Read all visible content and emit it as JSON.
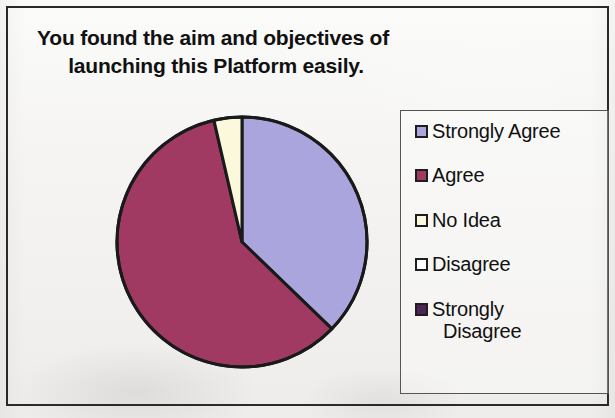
{
  "chart_data": {
    "type": "pie",
    "title": "You found the aim and objectives of launching this Platform easily.",
    "title_line1": "You found the aim and objectives of",
    "title_line2": "launching this Platform easily.",
    "categories": [
      "Strongly Agree",
      "Agree",
      "No Idea",
      "Disagree",
      "Strongly Disagree"
    ],
    "values": [
      37,
      59,
      4,
      0,
      0
    ],
    "units": "percent",
    "colors": [
      "#aaa6dd",
      "#a03a63",
      "#fbf8dc",
      "#ffffff",
      "#4d2456"
    ],
    "start_angle_deg": 0,
    "direction": "clockwise",
    "legend_position": "right",
    "grid": false,
    "data_labels_shown": false,
    "slice_outline_color": "#1a1a1a",
    "slices": [
      {
        "label": "Strongly Agree",
        "value": 37,
        "color": "#aaa6dd",
        "start_deg": 0,
        "end_deg": 134
      },
      {
        "label": "Agree",
        "value": 59,
        "color": "#a03a63",
        "start_deg": 134,
        "end_deg": 347
      },
      {
        "label": "No Idea",
        "value": 4,
        "color": "#fbf8dc",
        "start_deg": 347,
        "end_deg": 360
      },
      {
        "label": "Disagree",
        "value": 0,
        "color": "#ffffff",
        "start_deg": 360,
        "end_deg": 360
      },
      {
        "label": "Strongly Disagree",
        "value": 0,
        "color": "#4d2456",
        "start_deg": 360,
        "end_deg": 360
      }
    ]
  },
  "legend": {
    "items": [
      {
        "label": "Strongly Agree",
        "color": "#aaa6dd",
        "label_line1": "Strongly Agree",
        "label_line2": ""
      },
      {
        "label": "Agree",
        "color": "#a03a63",
        "label_line1": "Agree",
        "label_line2": ""
      },
      {
        "label": "No Idea",
        "color": "#fbf8dc",
        "label_line1": "No Idea",
        "label_line2": ""
      },
      {
        "label": "Disagree",
        "color": "#ffffff",
        "label_line1": "Disagree",
        "label_line2": ""
      },
      {
        "label": "Strongly Disagree",
        "color": "#4d2456",
        "label_line1": "Strongly",
        "label_line2": "Disagree"
      }
    ]
  }
}
